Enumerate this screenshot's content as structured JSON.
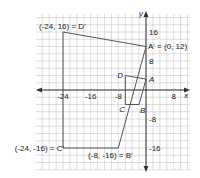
{
  "diagram": {
    "type": "coordinate-plane-dilation",
    "axes": {
      "x_label": "x",
      "y_label": "y",
      "x_ticks": [
        {
          "value": -24,
          "label": "-24"
        },
        {
          "value": -16,
          "label": "-16"
        },
        {
          "value": -8,
          "label": "-8"
        },
        {
          "value": 8,
          "label": "8"
        }
      ],
      "y_ticks": [
        {
          "value": 16,
          "label": "16"
        },
        {
          "value": 8,
          "label": "8"
        },
        {
          "value": -8,
          "label": "-8"
        },
        {
          "value": -16,
          "label": "-16"
        }
      ],
      "grid_step": 2,
      "x_range": [
        -28,
        12
      ],
      "y_range": [
        -22,
        24
      ]
    },
    "original": {
      "name": "ABCD",
      "vertices": [
        {
          "name": "A",
          "label": "A",
          "x": 0,
          "y": 3
        },
        {
          "name": "B",
          "label": "B",
          "x": -2,
          "y": -4
        },
        {
          "name": "C",
          "label": "C",
          "x": -6,
          "y": -4
        },
        {
          "name": "D",
          "label": "D",
          "x": -6,
          "y": 4
        }
      ]
    },
    "image": {
      "name": "A'B'C'D'",
      "vertices": [
        {
          "name": "A'",
          "label": "A' = (0, 12)",
          "x": 0,
          "y": 12
        },
        {
          "name": "B'",
          "label": "(-8, -16) = B'",
          "x": -8,
          "y": -16
        },
        {
          "name": "C'",
          "label": "(-24, -16) = C'",
          "x": -24,
          "y": -16
        },
        {
          "name": "D'",
          "label": "(-24, 16) = D'",
          "x": -24,
          "y": 16
        }
      ]
    },
    "colors": {
      "grid": "#c8c8c8",
      "axis": "#333333",
      "shape": "#555555",
      "text": "#222222"
    }
  }
}
